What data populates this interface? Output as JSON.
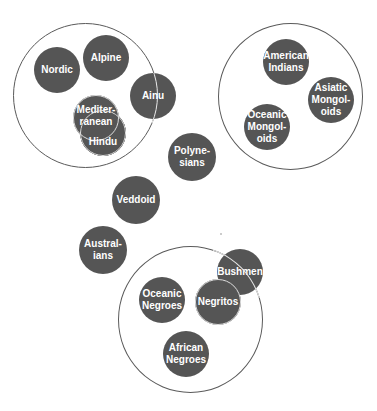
{
  "diagram": {
    "groups": [
      {
        "id": "caucasoid-group",
        "members": [
          "Nordic",
          "Alpine",
          "Mediterranean",
          "Hindu",
          "Ainu"
        ]
      },
      {
        "id": "mongoloid-group",
        "members": [
          "American Indians",
          "Asiatic Mongoloids",
          "Oceanic Mongoloids"
        ]
      },
      {
        "id": "negroid-group",
        "members": [
          "Bushmen",
          "Negritos",
          "Oceanic Negroes",
          "African Negroes"
        ]
      }
    ],
    "nodes": {
      "nordic": "Nordic",
      "alpine": "Alpine",
      "ainu": "Ainu",
      "mediterranean": "Mediter-\nranean",
      "hindu": "Hindu",
      "american_indians": "American\nIndians",
      "asiatic_mongoloids": "Asiatic\nMongol-\noids",
      "oceanic_mongoloids": "Oceanic\nMongol-\noids",
      "polynesians": "Polyne-\nsians",
      "veddoid": "Veddoid",
      "australians": "Austral-\nians",
      "bushmen": "Bushmen",
      "negritos": "Negritos",
      "oceanic_negroes": "Oceanic\nNegroes",
      "african_negroes": "African\nNegroes"
    },
    "colors": {
      "node_fill": "#555555",
      "node_text": "#ffffff",
      "group_stroke": "#5a5a5a",
      "background": "#ffffff"
    }
  }
}
